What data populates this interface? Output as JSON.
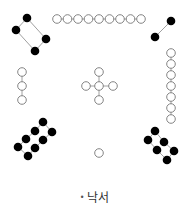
{
  "caption": {
    "bullet": "•",
    "text": "낙서"
  },
  "colors": {
    "black_dot": "#000000",
    "white_dot_stroke": "#777777",
    "connector": "#888888"
  },
  "groups": [
    {
      "number": 4,
      "position": "top-left",
      "type": "black",
      "dots": [
        [
          27,
          18
        ],
        [
          16,
          30
        ],
        [
          46,
          39
        ],
        [
          35,
          51
        ]
      ],
      "links": [
        [
          0,
          1
        ],
        [
          0,
          2
        ],
        [
          1,
          3
        ],
        [
          2,
          3
        ]
      ]
    },
    {
      "number": 9,
      "position": "top",
      "type": "white",
      "dots": [
        [
          57,
          19
        ],
        [
          67.5,
          19
        ],
        [
          78,
          19
        ],
        [
          88.5,
          19
        ],
        [
          99,
          19
        ],
        [
          109.5,
          19
        ],
        [
          120,
          19
        ],
        [
          130.5,
          19
        ],
        [
          141,
          19
        ]
      ],
      "links": [
        [
          0,
          1
        ],
        [
          1,
          2
        ],
        [
          2,
          3
        ],
        [
          3,
          4
        ],
        [
          4,
          5
        ],
        [
          5,
          6
        ],
        [
          6,
          7
        ],
        [
          7,
          8
        ]
      ]
    },
    {
      "number": 2,
      "position": "top-right",
      "type": "black",
      "dots": [
        [
          171,
          21
        ],
        [
          155,
          37
        ]
      ],
      "links": [
        [
          0,
          1
        ]
      ]
    },
    {
      "number": 3,
      "position": "left",
      "type": "white",
      "dots": [
        [
          22,
          72
        ],
        [
          22,
          86
        ],
        [
          22,
          100
        ]
      ],
      "links": [
        [
          0,
          1
        ],
        [
          1,
          2
        ]
      ]
    },
    {
      "number": 5,
      "position": "center",
      "type": "white",
      "dots": [
        [
          99,
          72
        ],
        [
          86,
          86
        ],
        [
          99,
          86
        ],
        [
          113,
          86
        ],
        [
          99,
          100
        ]
      ],
      "links": [
        [
          0,
          2
        ],
        [
          1,
          2
        ],
        [
          2,
          3
        ],
        [
          2,
          4
        ]
      ]
    },
    {
      "number": 7,
      "position": "right",
      "type": "white",
      "dots": [
        [
          171,
          53
        ],
        [
          171,
          64
        ],
        [
          171,
          75
        ],
        [
          171,
          86
        ],
        [
          171,
          97
        ],
        [
          171,
          108
        ],
        [
          171,
          119
        ]
      ],
      "links": [
        [
          0,
          1
        ],
        [
          1,
          2
        ],
        [
          2,
          3
        ],
        [
          3,
          4
        ],
        [
          4,
          5
        ],
        [
          5,
          6
        ]
      ]
    },
    {
      "number": 8,
      "position": "bottom-left",
      "type": "black",
      "dots": [
        [
          43,
          122
        ],
        [
          35,
          131
        ],
        [
          26,
          139
        ],
        [
          18,
          147
        ],
        [
          52,
          132
        ],
        [
          43,
          140
        ],
        [
          35,
          148
        ],
        [
          28,
          156
        ]
      ],
      "links": [
        [
          0,
          1
        ],
        [
          1,
          2
        ],
        [
          2,
          3
        ],
        [
          4,
          5
        ],
        [
          5,
          6
        ],
        [
          6,
          7
        ],
        [
          0,
          4
        ],
        [
          3,
          7
        ]
      ]
    },
    {
      "number": 1,
      "position": "bottom",
      "type": "white",
      "dots": [
        [
          99,
          153
        ]
      ],
      "links": []
    },
    {
      "number": 6,
      "position": "bottom-right",
      "type": "black",
      "dots": [
        [
          155,
          131
        ],
        [
          148,
          140
        ],
        [
          164,
          142
        ],
        [
          157,
          150
        ],
        [
          174,
          151
        ],
        [
          167,
          160
        ]
      ],
      "links": [
        [
          0,
          2
        ],
        [
          2,
          4
        ],
        [
          1,
          3
        ],
        [
          3,
          5
        ],
        [
          0,
          1
        ],
        [
          4,
          5
        ]
      ]
    }
  ]
}
